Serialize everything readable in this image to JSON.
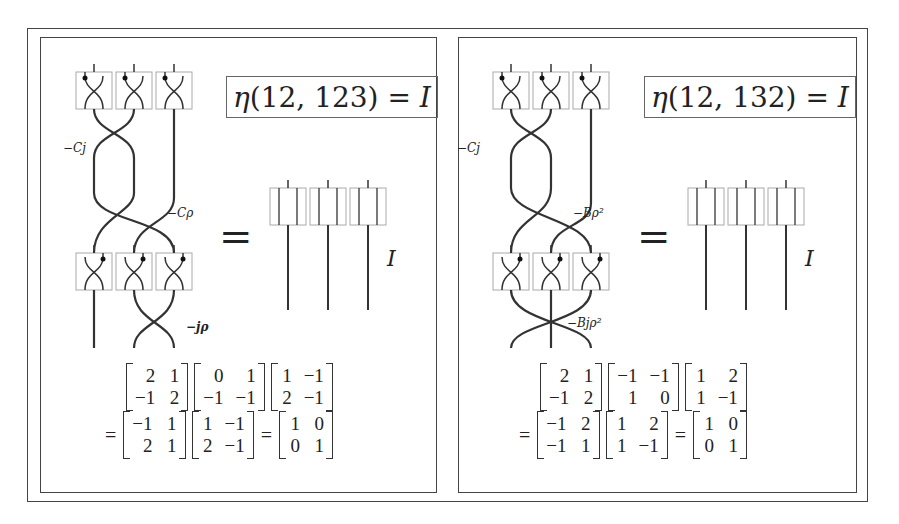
{
  "panels": [
    {
      "title": {
        "fn": "η",
        "args": "(12, 123)",
        "eq": " = ",
        "rhs": "I"
      },
      "equals_sign": "=",
      "identity_label": "I",
      "crossing_labels": [
        "−Cj",
        "−Cρ",
        "−jρ"
      ],
      "matrices_line1": [
        [
          [
            "2",
            "1"
          ],
          [
            "−1",
            "2"
          ]
        ],
        [
          [
            "0",
            "1"
          ],
          [
            "−1",
            "−1"
          ]
        ],
        [
          [
            "1",
            "−1"
          ],
          [
            "2",
            "−1"
          ]
        ]
      ],
      "matrices_line2": [
        [
          [
            "−1",
            "1"
          ],
          [
            "2",
            "1"
          ]
        ],
        [
          [
            "1",
            "−1"
          ],
          [
            "2",
            "−1"
          ]
        ],
        [
          [
            "1",
            "0"
          ],
          [
            "0",
            "1"
          ]
        ]
      ],
      "line2_ops": [
        "=",
        "",
        "="
      ]
    },
    {
      "title": {
        "fn": "η",
        "args": "(12, 132)",
        "eq": " = ",
        "rhs": "I"
      },
      "equals_sign": "=",
      "identity_label": "I",
      "crossing_labels": [
        "−Cj",
        "−Bρ²",
        "−Bjρ²"
      ],
      "matrices_line1": [
        [
          [
            "2",
            "1"
          ],
          [
            "−1",
            "2"
          ]
        ],
        [
          [
            "−1",
            "−1"
          ],
          [
            "1",
            "0"
          ]
        ],
        [
          [
            "1",
            "2"
          ],
          [
            "1",
            "−1"
          ]
        ]
      ],
      "matrices_line2": [
        [
          [
            "−1",
            "2"
          ],
          [
            "−1",
            "1"
          ]
        ],
        [
          [
            "1",
            "2"
          ],
          [
            "1",
            "−1"
          ]
        ],
        [
          [
            "1",
            "0"
          ],
          [
            "0",
            "1"
          ]
        ]
      ],
      "line2_ops": [
        "=",
        "",
        "="
      ]
    }
  ]
}
